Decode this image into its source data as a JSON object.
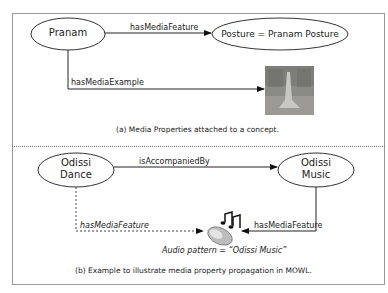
{
  "panel_a": {
    "nodes": {
      "pranam": "Pranam",
      "posture": "Posture = Pranam Posture"
    },
    "edges": {
      "has_media_feature": "hasMediaFeature",
      "has_media_example": "hasMediaExample"
    },
    "image": "posture-photo",
    "caption": "(a) Media Properties attached to a concept."
  },
  "panel_b": {
    "nodes": {
      "odissi_dance_1": "Odissi",
      "odissi_dance_2": "Dance",
      "odissi_music_1": "Odissi",
      "odissi_music_2": "Music"
    },
    "edges": {
      "is_accompanied_by": "isAccompaniedBy",
      "has_media_feature_dance": "hasMediaFeature",
      "has_media_feature_music": "hasMediaFeature"
    },
    "icon": "audio-speaker-icon",
    "audio_label": "Audio pattern = “Odissi Music”",
    "caption": "(b) Example to illustrate media property propagation in MOWL."
  }
}
